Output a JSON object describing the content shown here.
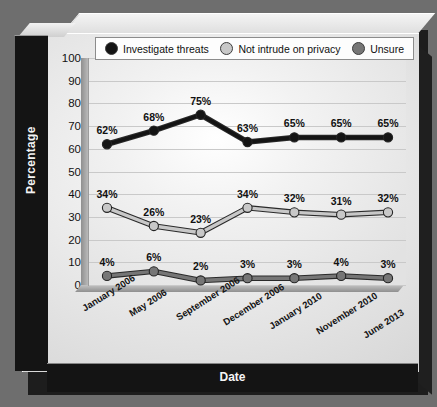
{
  "chart_data": {
    "type": "line",
    "title": "",
    "xlabel": "Date",
    "ylabel": "Percentage",
    "categories": [
      "January 2006",
      "May 2006",
      "September 2006",
      "December 2006",
      "January 2010",
      "November 2010",
      "June 2013"
    ],
    "series": [
      {
        "name": "Investigate threats",
        "color": "#141414",
        "values": [
          62,
          68,
          75,
          63,
          65,
          65,
          65
        ],
        "labels": [
          "62%",
          "68%",
          "75%",
          "63%",
          "65%",
          "65%",
          "65%"
        ]
      },
      {
        "name": "Not intrude on privacy",
        "color": "#c8c8c8",
        "values": [
          34,
          26,
          23,
          34,
          32,
          31,
          32
        ],
        "labels": [
          "34%",
          "26%",
          "23%",
          "34%",
          "32%",
          "31%",
          "32%"
        ]
      },
      {
        "name": "Unsure",
        "color": "#767676",
        "values": [
          4,
          6,
          2,
          3,
          3,
          4,
          3
        ],
        "labels": [
          "4%",
          "6%",
          "2%",
          "3%",
          "3%",
          "4%",
          "3%"
        ]
      }
    ],
    "ylim": [
      0,
      100
    ],
    "yticks": [
      "0",
      "10",
      "20",
      "30",
      "40",
      "50",
      "60",
      "70",
      "80",
      "90",
      "100"
    ],
    "grid": true,
    "legend_position": "top"
  },
  "legend": {
    "items": [
      {
        "label": "Investigate threats",
        "color": "#141414"
      },
      {
        "label": "Not intrude on privacy",
        "color": "#c8c8c8"
      },
      {
        "label": "Unsure",
        "color": "#767676"
      }
    ]
  },
  "axes": {
    "y_title": "Percentage",
    "x_title": "Date"
  },
  "colors": {
    "background": "#6e6e6e",
    "panel": "#ececec",
    "plot": "#f2f2f2",
    "gridline": "#c9c9c9",
    "band": "#141414"
  }
}
